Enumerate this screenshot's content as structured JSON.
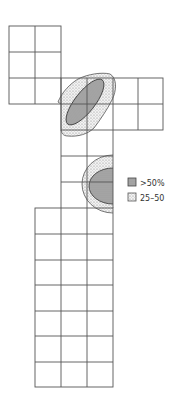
{
  "diagram": {
    "type": "grid-map-with-density-contours",
    "cell_size": 26,
    "colors": {
      "grid_line": "#555555",
      "high_fill": "#a9a9a9",
      "high_stroke": "#444444",
      "mid_fill": "#e6e6e6",
      "mid_stroke": "#555555",
      "background": "#ffffff"
    },
    "grid_blocks": [
      {
        "name": "top-left-block",
        "x": 9,
        "y": 26,
        "cols": 2,
        "rows": 3
      },
      {
        "name": "middle-row-block",
        "x": 61,
        "y": 78,
        "cols": 4,
        "rows": 2
      },
      {
        "name": "central-column-block",
        "x": 61,
        "y": 130,
        "cols": 2,
        "rows": 3
      },
      {
        "name": "bottom-block",
        "x": 35,
        "y": 208,
        "cols": 3,
        "rows": 7
      }
    ],
    "regions": [
      {
        "name": "upper-cluster",
        "level": "25-50",
        "shape": "outer-contour"
      },
      {
        "name": "upper-cluster",
        "level": ">50%",
        "shape": "inner-ellipse"
      },
      {
        "name": "lower-cluster",
        "level": "25-50",
        "shape": "outer-half-ring"
      },
      {
        "name": "lower-cluster",
        "level": ">50%",
        "shape": "inner-half-ellipse"
      }
    ]
  },
  "legend": {
    "items": [
      {
        "label": ">50%",
        "swatch": "high"
      },
      {
        "label": "25–50",
        "swatch": "mid"
      }
    ]
  }
}
